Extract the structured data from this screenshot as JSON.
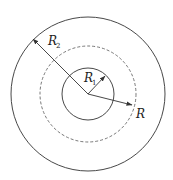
{
  "diagram": {
    "title": "",
    "center": {
      "x": 88,
      "y": 94
    },
    "circles": [
      {
        "name": "outer-circle",
        "r": 77,
        "style": "solid"
      },
      {
        "name": "dashed-circle",
        "r": 48,
        "style": "dashed"
      },
      {
        "name": "inner-circle",
        "r": 26,
        "style": "solid"
      }
    ],
    "arrows": [
      {
        "name": "r2-arrow",
        "to": {
          "x": 33,
          "y": 39
        }
      },
      {
        "name": "r1-arrow",
        "to": {
          "x": 105,
          "y": 76
        }
      },
      {
        "name": "r-arrow",
        "to": {
          "x": 132,
          "y": 105
        }
      }
    ],
    "labels": {
      "r2": {
        "main": "R",
        "sub": "2"
      },
      "r1": {
        "main": "R",
        "sub": "1"
      },
      "r": {
        "main": "R"
      }
    },
    "stroke_color": "#333333"
  }
}
